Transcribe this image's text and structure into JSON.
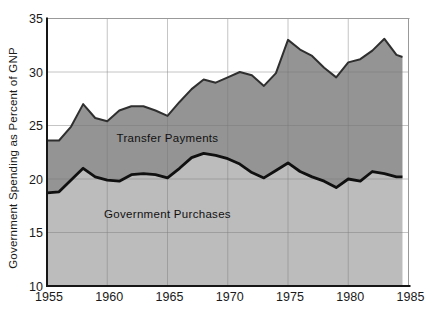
{
  "page": {
    "background": "#ffffff"
  },
  "chart_data": {
    "type": "area",
    "stacked": true,
    "title": "",
    "xlabel": "",
    "ylabel": "Government Spending as Percent of GNP",
    "xlim": [
      1955,
      1985
    ],
    "ylim": [
      10,
      35
    ],
    "xticks": [
      1955,
      1960,
      1965,
      1970,
      1975,
      1980,
      1985
    ],
    "yticks": [
      10,
      15,
      20,
      25,
      30,
      35
    ],
    "grid": true,
    "legend_position": "none",
    "x": [
      1955,
      1956,
      1957,
      1958,
      1959,
      1960,
      1961,
      1962,
      1963,
      1964,
      1965,
      1966,
      1967,
      1968,
      1969,
      1970,
      1971,
      1972,
      1973,
      1974,
      1975,
      1976,
      1977,
      1978,
      1979,
      1980,
      1981,
      1982,
      1983,
      1984,
      1984.5
    ],
    "series": [
      {
        "name": "Government Purchases",
        "band": "lower",
        "fill": "#bcbcbc",
        "line_color": "#101010",
        "line_width": 2.8,
        "values": [
          18.7,
          18.8,
          19.9,
          21.0,
          20.2,
          19.9,
          19.8,
          20.4,
          20.5,
          20.4,
          20.1,
          21.0,
          22.0,
          22.4,
          22.2,
          21.9,
          21.4,
          20.6,
          20.1,
          20.8,
          21.5,
          20.7,
          20.2,
          19.8,
          19.2,
          20.0,
          19.8,
          20.7,
          20.5,
          20.2,
          20.2
        ]
      },
      {
        "name": "Total: Government Purchases plus Transfer Payments",
        "band": "upper",
        "fill": "#949494",
        "line_color": "#2f2f2f",
        "line_width": 2,
        "values": [
          23.6,
          23.6,
          24.9,
          27.0,
          25.7,
          25.4,
          26.4,
          26.8,
          26.8,
          26.4,
          25.9,
          27.2,
          28.4,
          29.3,
          29.0,
          29.5,
          30.0,
          29.7,
          28.7,
          29.9,
          33.0,
          32.1,
          31.5,
          30.4,
          29.5,
          30.9,
          31.2,
          32.0,
          33.1,
          31.6,
          31.4
        ]
      }
    ],
    "annotations": [
      {
        "text": "Transfer Payments",
        "x": 1965,
        "y": 23.8
      },
      {
        "text": "Government Purchases",
        "x": 1965,
        "y": 16.7
      }
    ],
    "colors": {
      "grid": "#777777",
      "axis": "#161616",
      "frame": "#999999",
      "tick_text": "#1a1a1a"
    }
  }
}
